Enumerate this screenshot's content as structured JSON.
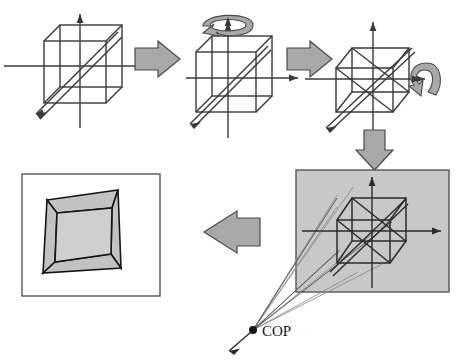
{
  "figure": {
    "labels": {
      "cop": "COP"
    },
    "colors": {
      "stroke": "#3a3a3a",
      "stroke_dark": "#151515",
      "arrow_fill": "#a8a8a8",
      "arrow_stroke": "#4a4a4a",
      "panel_gray": "#c8c8c8",
      "panel_white": "#ffffff",
      "panel_border": "#555555",
      "face_fill": "#c2c2c2",
      "ray_light": "#9a9a9a",
      "background": "#ffffff"
    }
  },
  "panels": [
    {
      "id": "panel-1",
      "name": "axis-aligned-cube",
      "description": "Cube aligned with world axes, z-axis diagonal toward lower-left"
    },
    {
      "id": "panel-2",
      "name": "cube-rotating-about-y",
      "description": "Cube with curved rotation arrow about the vertical y-axis"
    },
    {
      "id": "panel-3",
      "name": "cube-rotating-about-x",
      "description": "Rotated cube with curved rotation arrow about the horizontal x-axis"
    },
    {
      "id": "panel-4",
      "name": "projection-with-cop",
      "description": "Gray view plane with cube and projection rays converging at the center of projection"
    },
    {
      "id": "panel-5",
      "name": "projected-image",
      "description": "Resulting perspective image of the cube in the view window"
    }
  ],
  "arrows": [
    {
      "id": "arrow-1",
      "name": "arrow-panel1-to-panel2",
      "direction": "right"
    },
    {
      "id": "arrow-2",
      "name": "arrow-panel2-to-panel3",
      "direction": "right"
    },
    {
      "id": "arrow-3",
      "name": "arrow-panel3-to-panel4",
      "direction": "down"
    },
    {
      "id": "arrow-4",
      "name": "arrow-panel4-to-panel5",
      "direction": "left"
    }
  ],
  "rotation_arrows": [
    {
      "id": "rot-y",
      "name": "rotation-arrow-y-axis",
      "axis": "y"
    },
    {
      "id": "rot-x",
      "name": "rotation-arrow-x-axis",
      "axis": "x"
    }
  ]
}
